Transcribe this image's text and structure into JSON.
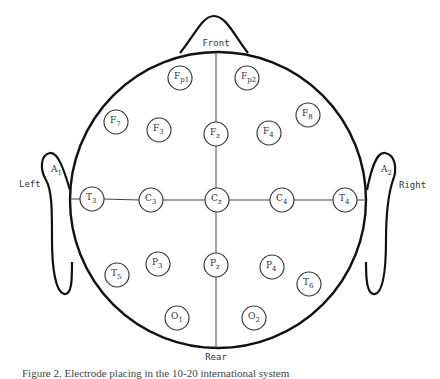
{
  "diagram": {
    "orientation_labels": {
      "front": "Front",
      "rear": "Rear",
      "left": "Left",
      "right": "Right"
    },
    "ears": [
      {
        "id": "A1",
        "base": "A",
        "sub": "1",
        "side": "left"
      },
      {
        "id": "A2",
        "base": "A",
        "sub": "2",
        "side": "right"
      }
    ],
    "electrodes": [
      {
        "id": "Fp1",
        "base": "F",
        "sub": "p1",
        "cx": 180,
        "cy": 78
      },
      {
        "id": "Fp2",
        "base": "F",
        "sub": "p2",
        "cx": 247,
        "cy": 78
      },
      {
        "id": "F7",
        "base": "F",
        "sub": "7",
        "cx": 116,
        "cy": 122
      },
      {
        "id": "F3",
        "base": "F",
        "sub": "3",
        "cx": 159,
        "cy": 130
      },
      {
        "id": "Fz",
        "base": "F",
        "sub": "z",
        "cx": 216,
        "cy": 134
      },
      {
        "id": "F4",
        "base": "F",
        "sub": "4",
        "cx": 269,
        "cy": 133
      },
      {
        "id": "F8",
        "base": "F",
        "sub": "8",
        "cx": 308,
        "cy": 115
      },
      {
        "id": "T3",
        "base": "T",
        "sub": "3",
        "cx": 92,
        "cy": 199
      },
      {
        "id": "C3",
        "base": "C",
        "sub": "3",
        "cx": 151,
        "cy": 200
      },
      {
        "id": "Cz",
        "base": "C",
        "sub": "z",
        "cx": 217,
        "cy": 200
      },
      {
        "id": "C4",
        "base": "C",
        "sub": "4",
        "cx": 282,
        "cy": 200
      },
      {
        "id": "T4",
        "base": "T",
        "sub": "4",
        "cx": 345,
        "cy": 200
      },
      {
        "id": "T5",
        "base": "T",
        "sub": "5",
        "cx": 117,
        "cy": 275
      },
      {
        "id": "P3",
        "base": "P",
        "sub": "3",
        "cx": 158,
        "cy": 264
      },
      {
        "id": "Pz",
        "base": "P",
        "sub": "z",
        "cx": 216,
        "cy": 265
      },
      {
        "id": "P4",
        "base": "P",
        "sub": "4",
        "cx": 272,
        "cy": 267
      },
      {
        "id": "T6",
        "base": "T",
        "sub": "6",
        "cx": 309,
        "cy": 284
      },
      {
        "id": "O1",
        "base": "O",
        "sub": "1",
        "cx": 177,
        "cy": 318
      },
      {
        "id": "O2",
        "base": "O",
        "sub": "2",
        "cx": 254,
        "cy": 318
      }
    ],
    "colors": {
      "outline": "#111111",
      "line": "#444444",
      "text": "#333333",
      "background": "#ffffff"
    }
  },
  "caption": "Figure 2. Electrode placing in the 10-20 international system"
}
